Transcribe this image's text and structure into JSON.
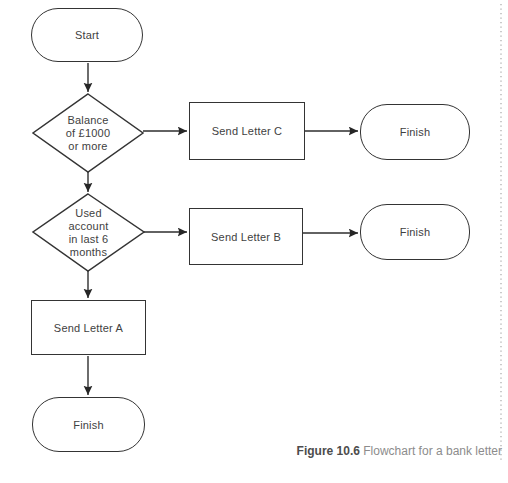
{
  "figure": {
    "caption_label": "Figure 10.6",
    "caption_text": " Flowchart for a bank letter"
  },
  "nodes": {
    "start": {
      "type": "terminator",
      "label": "Start"
    },
    "decision_balance": {
      "type": "decision",
      "label": "Balance\nof £1000\nor more"
    },
    "send_letter_c": {
      "type": "process",
      "label": "Send Letter C"
    },
    "finish_c": {
      "type": "terminator",
      "label": "Finish"
    },
    "decision_used_account": {
      "type": "decision",
      "label": "Used\naccount\nin last 6\nmonths"
    },
    "send_letter_b": {
      "type": "process",
      "label": "Send Letter B"
    },
    "finish_b": {
      "type": "terminator",
      "label": "Finish"
    },
    "send_letter_a": {
      "type": "process",
      "label": "Send Letter A"
    },
    "finish_a": {
      "type": "terminator",
      "label": "Finish"
    }
  },
  "edges": [
    {
      "from": "start",
      "to": "decision_balance"
    },
    {
      "from": "decision_balance",
      "to": "send_letter_c"
    },
    {
      "from": "send_letter_c",
      "to": "finish_c"
    },
    {
      "from": "decision_balance",
      "to": "decision_used_account"
    },
    {
      "from": "decision_used_account",
      "to": "send_letter_b"
    },
    {
      "from": "send_letter_b",
      "to": "finish_b"
    },
    {
      "from": "decision_used_account",
      "to": "send_letter_a"
    },
    {
      "from": "send_letter_a",
      "to": "finish_a"
    }
  ],
  "colors": {
    "line": "#2e2e2e",
    "shape_border": "#343434",
    "shape_text": "#414141",
    "caption_label": "#4c4c4c",
    "caption_text": "#8c8c8c",
    "margin_dots": "#a8a8a8",
    "background": "#ffffff"
  }
}
